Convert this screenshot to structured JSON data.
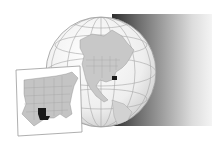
{
  "map": {
    "type": "locator-map",
    "globe": {
      "region_shown": "North America",
      "highlighted_region": "Louisiana",
      "highlight_color": "#1a1a1a",
      "land_color": "#c8c8c8",
      "ocean_color": "#f2f2f2",
      "graticule_color": "#9a9a9a"
    },
    "inset": {
      "region_shown": "Eastern United States",
      "highlighted_state": "Louisiana",
      "highlight_color": "#1a1a1a",
      "state_fill": "#c4c4c4",
      "border_color": "#8a8a8a",
      "frame_color": "#9a9a9a"
    },
    "shadow_gradient": [
      "#2e2e2e",
      "#f4f4f4"
    ]
  }
}
